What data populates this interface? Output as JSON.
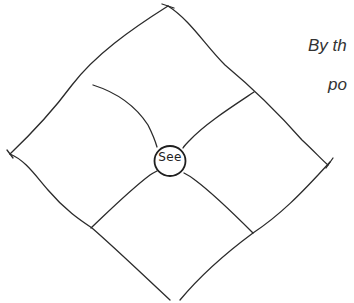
{
  "diagram": {
    "type": "hand-drawn quadrant diamond",
    "center_label": "See",
    "quadrants": 4,
    "colors": {
      "background": "#ffffff",
      "ink": "#2b2b2b",
      "text": "#333333"
    }
  },
  "side_text": {
    "line1": "By th",
    "line2": "po"
  }
}
